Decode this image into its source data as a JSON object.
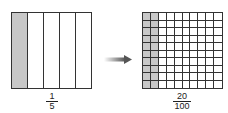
{
  "left_model": {
    "columns": 5,
    "shaded_columns": 1,
    "fraction": {
      "numerator": "1",
      "denominator": "5"
    }
  },
  "right_model": {
    "columns": 10,
    "rows": 10,
    "shaded_columns": 2,
    "fraction": {
      "numerator": "20",
      "denominator": "100"
    }
  },
  "colors": {
    "shade": "#c8c8c8",
    "line": "#333333",
    "arrow": "#666666"
  }
}
